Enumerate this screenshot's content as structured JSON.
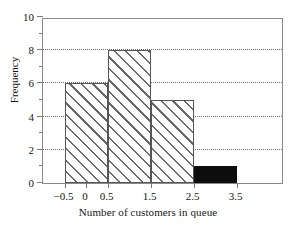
{
  "chart_data": {
    "type": "bar",
    "title": "",
    "subtitle": "",
    "xlabel": "Number of customers in queue",
    "ylabel": "Frequency",
    "categories": [
      "-0.5 to 0.5",
      "0.5 to 1.5",
      "1.5 to 2.5",
      "2.5 to 3.5"
    ],
    "bin_edges": [
      -0.5,
      0.5,
      1.5,
      2.5,
      3.5
    ],
    "values": [
      6,
      8,
      5,
      1
    ],
    "bar_styles": [
      "hatched",
      "hatched",
      "hatched",
      "solid-black"
    ],
    "xlim": [
      -1.0,
      4.6
    ],
    "ylim": [
      0,
      10
    ],
    "x_tick_labels": [
      "0",
      "−0.5",
      "0.5",
      "1.5",
      "2.5",
      "3.5"
    ],
    "x_tick_values": [
      0,
      -0.5,
      0.5,
      1.5,
      2.5,
      3.5
    ],
    "y_tick_labels": [
      "0",
      "2",
      "4",
      "6",
      "8",
      "10"
    ],
    "y_tick_values": [
      0,
      2,
      4,
      6,
      8,
      10
    ],
    "y_minor_tick_values": [
      1,
      3,
      5,
      7,
      9
    ],
    "gridlines": {
      "axis": "y",
      "values": [
        2,
        4,
        6,
        8
      ],
      "style": "dotted"
    },
    "legend": null,
    "annotations": [],
    "colors": {
      "frame": "#8a8a8a",
      "gridline": "#6e6e6e",
      "bar_outline": "#555555",
      "hatch": "#6a6a6a",
      "solid_bar": "#0d0d0d",
      "background": "#ffffff",
      "text": "#151515"
    }
  }
}
